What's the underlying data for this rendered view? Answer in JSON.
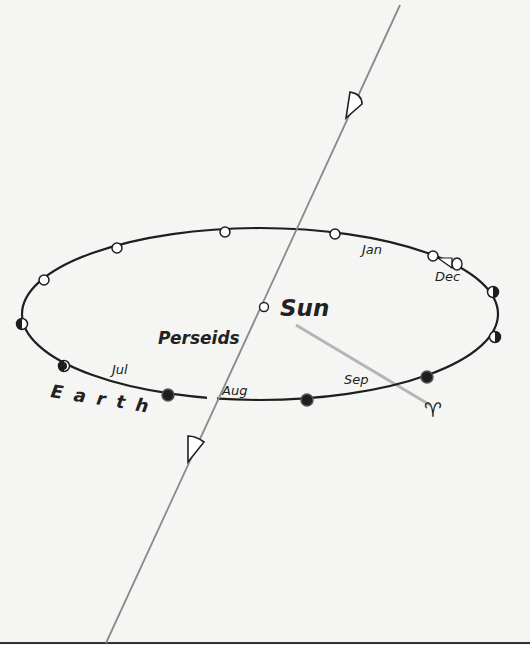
{
  "diagram": {
    "labels": {
      "sun": "Sun",
      "stream": "Perseids",
      "planet": "Earth",
      "vernal_equinox_symbol": "♈"
    },
    "months": {
      "jan": "Jan",
      "dec": "Dec",
      "jul": "Jul",
      "aug": "Aug",
      "sep": "Sep"
    },
    "colors": {
      "background": "#f5f5f3",
      "orbit": "#1e1e1e",
      "stream_line": "#8a8a8a",
      "equinox_line": "#b5b5b5"
    }
  }
}
